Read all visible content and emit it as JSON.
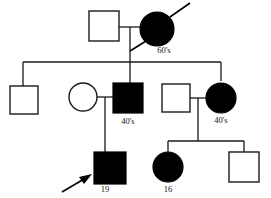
{
  "figure": {
    "kind": "pedigree-chart",
    "generations": 3,
    "ink_color": "#000000",
    "background_color": "#ffffff"
  },
  "generation_i": {
    "father": {
      "symbol": "square",
      "fill": "open",
      "label": ""
    },
    "mother": {
      "symbol": "circle",
      "fill": "filled",
      "label": "60's",
      "deceased": "yes"
    }
  },
  "generation_ii": {
    "sibling_1": {
      "symbol": "square",
      "fill": "open",
      "label": ""
    },
    "spouse_in_left": {
      "symbol": "circle",
      "fill": "open",
      "label": ""
    },
    "sibling_2": {
      "symbol": "square",
      "fill": "filled",
      "label": "40's"
    },
    "spouse_in_right": {
      "symbol": "square",
      "fill": "open",
      "label": ""
    },
    "sibling_3": {
      "symbol": "circle",
      "fill": "filled",
      "label": "40's"
    }
  },
  "generation_iii": {
    "proband": {
      "symbol": "square",
      "fill": "filled",
      "label": "19",
      "marker": "proband-arrow"
    },
    "cousin_1": {
      "symbol": "circle",
      "fill": "filled",
      "label": "16"
    },
    "cousin_2": {
      "symbol": "square",
      "fill": "open",
      "label": ""
    }
  }
}
